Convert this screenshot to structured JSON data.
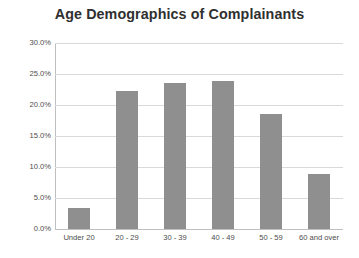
{
  "chart_data": {
    "type": "bar",
    "title": "Age Demographics of Complainants",
    "xlabel": "",
    "ylabel": "",
    "categories": [
      "Under 20",
      "20 - 29",
      "30 - 39",
      "40 - 49",
      "50 - 59",
      "60 and over"
    ],
    "values": [
      3.4,
      22.2,
      23.5,
      23.9,
      18.5,
      8.9
    ],
    "value_labels": [
      "3.4%",
      "22.2%",
      "23.5%",
      "23.9%",
      "18.5%",
      "8.9%"
    ],
    "ylim": [
      0,
      30
    ],
    "ytick_values": [
      0,
      5,
      10,
      15,
      20,
      25,
      30
    ],
    "ytick_labels": [
      "0.0%",
      "5.0%",
      "10.0%",
      "15.0%",
      "20.0%",
      "25.0%",
      "30.0%"
    ],
    "grid": true,
    "legend": false,
    "legend_position": "none",
    "bar_color": "#8f8f8f",
    "gridline_color": "#d9d9d9",
    "axis_color": "#bfbfbf",
    "title_color": "#2f2f2f",
    "tick_label_color": "#4d4d4d",
    "background_color": "#ffffff"
  }
}
